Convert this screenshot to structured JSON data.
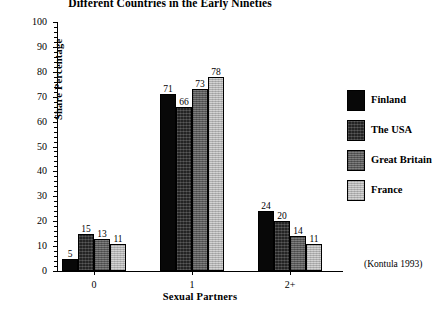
{
  "chart_data": {
    "type": "bar",
    "title": "Different Countries in the Early Nineties",
    "xlabel": "Sexual Partners",
    "ylabel": "Share Percentage",
    "ylim": [
      0,
      100
    ],
    "ytick_step": 10,
    "yticks": [
      "0",
      "10",
      "20",
      "30",
      "40",
      "50",
      "60",
      "70",
      "80",
      "90",
      "100"
    ],
    "grid": false,
    "legend_position": "right",
    "categories": [
      "0",
      "1",
      "2+"
    ],
    "series": [
      {
        "name": "Finland",
        "values": [
          5,
          71,
          24
        ],
        "color": "#080808"
      },
      {
        "name": "The USA",
        "values": [
          15,
          66,
          20
        ],
        "color": "#242424"
      },
      {
        "name": "Great Britain",
        "values": [
          13,
          73,
          14
        ],
        "color": "#6f6f6f"
      },
      {
        "name": "France",
        "values": [
          11,
          78,
          11
        ],
        "color": "#c9c9c9"
      }
    ],
    "annotations": [
      "(Kontula 1993)"
    ]
  },
  "source_note": "(Kontula 1993)"
}
